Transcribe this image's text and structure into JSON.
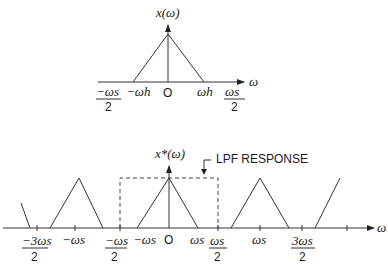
{
  "top_plot": {
    "y_label": "x(ω)",
    "x_label": "ω",
    "ticks": {
      "neg_wh": "−ωh",
      "origin": "O",
      "pos_wh": "ωh"
    },
    "fractions": {
      "left_num": "−ωs",
      "left_den": "2",
      "right_num": "ωs",
      "right_den": "2"
    }
  },
  "bottom_plot": {
    "y_label": "x*(ω)",
    "x_label": "ω",
    "annotation": "LPF RESPONSE",
    "ticks": {
      "neg_3ws_num": "−3ωs",
      "neg_3ws_den": "2",
      "neg_ws": "−ωs",
      "neg_half_ws_num": "−ωs",
      "neg_half_ws_den": "2",
      "neg_ws_inner": "−ωs",
      "origin": "O",
      "ws_inner": "ωs",
      "half_ws_num": "ωs",
      "half_ws_den": "2",
      "ws": "ωs",
      "three_half_ws_num": "3ωs",
      "three_half_ws_den": "2"
    }
  }
}
